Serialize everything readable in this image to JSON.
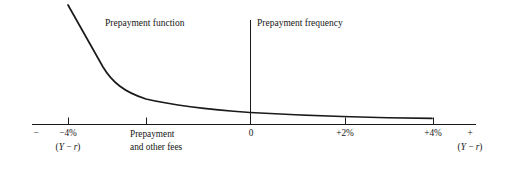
{
  "figure": {
    "name": "prepayment-function-curve",
    "background_color": "#ffffff",
    "line_color": "#1a1a1a"
  },
  "annotations": {
    "curve_label": "Prepayment function",
    "region_label": "Prepayment frequency"
  },
  "axis": {
    "left_sign": "−",
    "right_sign": "+",
    "left_unit": "(Y − r)",
    "right_unit": "(Y − r)",
    "origin_label": "0",
    "fees_label_line1": "Prepayment",
    "fees_label_line2": "and other fees"
  },
  "chart_data": {
    "type": "line",
    "title": "",
    "xlabel": "(Y − r)",
    "ylabel": "Prepayment frequency",
    "xlim": [
      -6.0,
      5.8
    ],
    "ylim": [
      0,
      1
    ],
    "grid": false,
    "legend": null,
    "tick_labels": [
      "−4%",
      "+2%",
      "+4%"
    ],
    "tick_values": [
      -4,
      2,
      4
    ],
    "extra_ticks": [
      {
        "value": -1.3,
        "label": "Prepayment and other fees"
      },
      {
        "value": 0,
        "label": "0"
      }
    ],
    "vertical_marker": {
      "x": 0,
      "label": "Prepayment frequency"
    },
    "series": [
      {
        "name": "Prepayment function",
        "x": [
          -4.0,
          -3.6,
          -3.2,
          -2.8,
          -2.4,
          -2.0,
          -1.6,
          -1.2,
          -0.8,
          -0.4,
          0.0,
          0.6,
          1.2,
          1.8,
          2.4,
          3.0,
          3.6,
          4.1
        ],
        "y": [
          0.955,
          0.855,
          0.755,
          0.655,
          0.54,
          0.43,
          0.34,
          0.285,
          0.252,
          0.232,
          0.215,
          0.197,
          0.18,
          0.166,
          0.155,
          0.148,
          0.144,
          0.143
        ]
      }
    ]
  }
}
